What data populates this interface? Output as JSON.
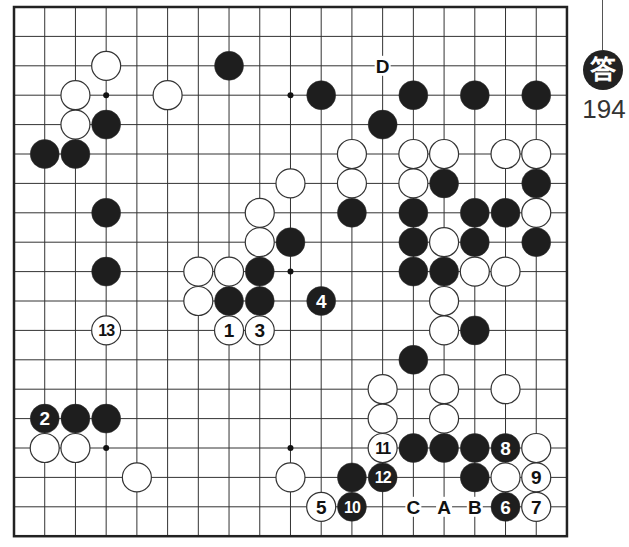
{
  "board": {
    "size": 19,
    "origin_x": 14,
    "origin_y": 7,
    "spacing_x": 30.72,
    "spacing_y": 29.4,
    "stone_radius": 14.5,
    "colors": {
      "line": "#333333",
      "black": "#1e1e1e",
      "white": "#ffffff",
      "border": "#222222"
    },
    "hoshi": [
      [
        3,
        3
      ],
      [
        9,
        3
      ],
      [
        15,
        3
      ],
      [
        3,
        9
      ],
      [
        9,
        9
      ],
      [
        15,
        9
      ],
      [
        3,
        15
      ],
      [
        9,
        15
      ],
      [
        15,
        15
      ]
    ],
    "stones": [
      {
        "c": 3,
        "r": 2,
        "color": "white"
      },
      {
        "c": 7,
        "r": 2,
        "color": "black"
      },
      {
        "c": 2,
        "r": 3,
        "color": "white"
      },
      {
        "c": 5,
        "r": 3,
        "color": "white"
      },
      {
        "c": 10,
        "r": 3,
        "color": "black"
      },
      {
        "c": 13,
        "r": 3,
        "color": "black"
      },
      {
        "c": 15,
        "r": 3,
        "color": "black"
      },
      {
        "c": 17,
        "r": 3,
        "color": "black"
      },
      {
        "c": 2,
        "r": 4,
        "color": "white"
      },
      {
        "c": 3,
        "r": 4,
        "color": "black"
      },
      {
        "c": 12,
        "r": 4,
        "color": "black"
      },
      {
        "c": 1,
        "r": 5,
        "color": "black"
      },
      {
        "c": 2,
        "r": 5,
        "color": "black"
      },
      {
        "c": 11,
        "r": 5,
        "color": "white"
      },
      {
        "c": 13,
        "r": 5,
        "color": "white"
      },
      {
        "c": 14,
        "r": 5,
        "color": "white"
      },
      {
        "c": 16,
        "r": 5,
        "color": "white"
      },
      {
        "c": 17,
        "r": 5,
        "color": "white"
      },
      {
        "c": 9,
        "r": 6,
        "color": "white"
      },
      {
        "c": 11,
        "r": 6,
        "color": "white"
      },
      {
        "c": 13,
        "r": 6,
        "color": "white"
      },
      {
        "c": 14,
        "r": 6,
        "color": "black"
      },
      {
        "c": 17,
        "r": 6,
        "color": "black"
      },
      {
        "c": 3,
        "r": 7,
        "color": "black"
      },
      {
        "c": 8,
        "r": 7,
        "color": "white"
      },
      {
        "c": 11,
        "r": 7,
        "color": "black"
      },
      {
        "c": 13,
        "r": 7,
        "color": "black"
      },
      {
        "c": 15,
        "r": 7,
        "color": "black"
      },
      {
        "c": 16,
        "r": 7,
        "color": "black"
      },
      {
        "c": 17,
        "r": 7,
        "color": "white"
      },
      {
        "c": 8,
        "r": 8,
        "color": "white"
      },
      {
        "c": 9,
        "r": 8,
        "color": "black"
      },
      {
        "c": 13,
        "r": 8,
        "color": "black"
      },
      {
        "c": 14,
        "r": 8,
        "color": "white"
      },
      {
        "c": 15,
        "r": 8,
        "color": "black"
      },
      {
        "c": 17,
        "r": 8,
        "color": "black"
      },
      {
        "c": 3,
        "r": 9,
        "color": "black"
      },
      {
        "c": 6,
        "r": 9,
        "color": "white"
      },
      {
        "c": 7,
        "r": 9,
        "color": "white"
      },
      {
        "c": 8,
        "r": 9,
        "color": "black"
      },
      {
        "c": 13,
        "r": 9,
        "color": "black"
      },
      {
        "c": 14,
        "r": 9,
        "color": "black"
      },
      {
        "c": 15,
        "r": 9,
        "color": "white"
      },
      {
        "c": 16,
        "r": 9,
        "color": "white"
      },
      {
        "c": 6,
        "r": 10,
        "color": "white"
      },
      {
        "c": 7,
        "r": 10,
        "color": "black"
      },
      {
        "c": 8,
        "r": 10,
        "color": "black"
      },
      {
        "c": 10,
        "r": 10,
        "color": "black",
        "label": "4"
      },
      {
        "c": 14,
        "r": 10,
        "color": "white"
      },
      {
        "c": 3,
        "r": 11,
        "color": "white",
        "label": "13"
      },
      {
        "c": 7,
        "r": 11,
        "color": "white",
        "label": "1"
      },
      {
        "c": 8,
        "r": 11,
        "color": "white",
        "label": "3"
      },
      {
        "c": 14,
        "r": 11,
        "color": "white"
      },
      {
        "c": 15,
        "r": 11,
        "color": "black"
      },
      {
        "c": 13,
        "r": 12,
        "color": "black"
      },
      {
        "c": 12,
        "r": 13,
        "color": "white"
      },
      {
        "c": 14,
        "r": 13,
        "color": "white"
      },
      {
        "c": 16,
        "r": 13,
        "color": "white"
      },
      {
        "c": 1,
        "r": 14,
        "color": "black",
        "label": "2"
      },
      {
        "c": 2,
        "r": 14,
        "color": "black"
      },
      {
        "c": 3,
        "r": 14,
        "color": "black"
      },
      {
        "c": 12,
        "r": 14,
        "color": "white"
      },
      {
        "c": 14,
        "r": 14,
        "color": "white"
      },
      {
        "c": 1,
        "r": 15,
        "color": "white"
      },
      {
        "c": 2,
        "r": 15,
        "color": "white"
      },
      {
        "c": 12,
        "r": 15,
        "color": "white",
        "label": "11"
      },
      {
        "c": 13,
        "r": 15,
        "color": "black"
      },
      {
        "c": 14,
        "r": 15,
        "color": "black"
      },
      {
        "c": 15,
        "r": 15,
        "color": "black"
      },
      {
        "c": 16,
        "r": 15,
        "color": "black",
        "label": "8"
      },
      {
        "c": 17,
        "r": 15,
        "color": "white"
      },
      {
        "c": 4,
        "r": 16,
        "color": "white"
      },
      {
        "c": 9,
        "r": 16,
        "color": "white"
      },
      {
        "c": 11,
        "r": 16,
        "color": "black"
      },
      {
        "c": 12,
        "r": 16,
        "color": "black",
        "label": "12"
      },
      {
        "c": 15,
        "r": 16,
        "color": "black"
      },
      {
        "c": 16,
        "r": 16,
        "color": "white"
      },
      {
        "c": 17,
        "r": 16,
        "color": "white",
        "label": "9"
      },
      {
        "c": 10,
        "r": 17,
        "color": "white",
        "label": "5"
      },
      {
        "c": 11,
        "r": 17,
        "color": "black",
        "label": "10"
      },
      {
        "c": 16,
        "r": 17,
        "color": "black",
        "label": "6"
      },
      {
        "c": 17,
        "r": 17,
        "color": "white",
        "label": "7"
      }
    ],
    "markers": [
      {
        "c": 12,
        "r": 2,
        "label": "D"
      },
      {
        "c": 13,
        "r": 17,
        "label": "C"
      },
      {
        "c": 14,
        "r": 17,
        "label": "A"
      },
      {
        "c": 15,
        "r": 17,
        "label": "B"
      }
    ]
  },
  "answer": {
    "badge_char": "答",
    "number": "194"
  }
}
